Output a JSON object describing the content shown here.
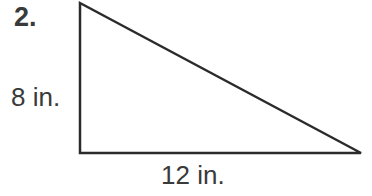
{
  "problem": {
    "number": "2.",
    "height_label": "8 in.",
    "base_label": "12 in."
  },
  "shape": {
    "type": "right-triangle",
    "height": 8,
    "base": 12,
    "unit": "in.",
    "stroke_color": "#2b2b2b"
  }
}
